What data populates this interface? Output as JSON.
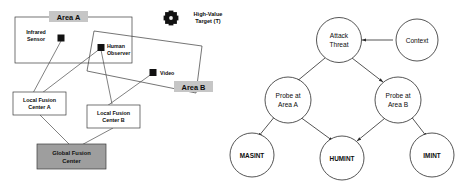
{
  "figure": {
    "left_panel": {
      "name": "sensor-deployment-map",
      "areas": [
        {
          "id": "area-a",
          "label": "Area A"
        },
        {
          "id": "area-b",
          "label": "Area B"
        }
      ],
      "sensors": [
        {
          "id": "infrared-sensor",
          "label_line1": "Infrared",
          "label_line2": "Sensor",
          "icon": "black-square-marker"
        },
        {
          "id": "human-observer",
          "label_line1": "Human",
          "label_line2": "Observer",
          "icon": "black-square-marker"
        },
        {
          "id": "video",
          "label_line1": "Video",
          "label_line2": "",
          "icon": "black-square-marker"
        }
      ],
      "fusion_centers": [
        {
          "id": "local-fusion-center-a",
          "line1": "Local Fusion",
          "line2": "Center A",
          "fill": "#ffffff"
        },
        {
          "id": "local-fusion-center-b",
          "line1": "Local Fusion",
          "line2": "Center B",
          "fill": "#ffffff"
        },
        {
          "id": "global-fusion-center",
          "line1": "Global Fusion",
          "line2": "Center",
          "fill": "#9e9e9e"
        }
      ],
      "legend": {
        "id": "high-value-target-legend",
        "icon": "high-value-target-icon",
        "line1": "High-Value",
        "line2": "Target (T)"
      }
    },
    "right_panel": {
      "name": "attack-threat-decision-tree",
      "nodes": [
        {
          "id": "attack-threat",
          "line1": "Attack",
          "line2": "Threat"
        },
        {
          "id": "context",
          "line1": "Context",
          "line2": ""
        },
        {
          "id": "probe-at-area-a",
          "line1": "Probe at",
          "line2": "Area A"
        },
        {
          "id": "probe-at-area-b",
          "line1": "Probe at",
          "line2": "Area B"
        },
        {
          "id": "masint",
          "line1": "MASINT",
          "line2": ""
        },
        {
          "id": "humint",
          "line1": "HUMINT",
          "line2": ""
        },
        {
          "id": "imint",
          "line1": "IMINT",
          "line2": ""
        }
      ],
      "edges": [
        {
          "from": "context",
          "to": "attack-threat"
        },
        {
          "from": "attack-threat",
          "to": "probe-at-area-a"
        },
        {
          "from": "attack-threat",
          "to": "probe-at-area-b"
        },
        {
          "from": "probe-at-area-a",
          "to": "masint"
        },
        {
          "from": "probe-at-area-a",
          "to": "humint"
        },
        {
          "from": "probe-at-area-b",
          "to": "humint"
        },
        {
          "from": "probe-at-area-b",
          "to": "imint"
        }
      ]
    },
    "colors": {
      "stroke": "#3a3a3a",
      "gray_fill": "#9e9e9e",
      "label_gray": "#c6c6c6",
      "marker": "#111111",
      "background": "#ffffff"
    }
  }
}
